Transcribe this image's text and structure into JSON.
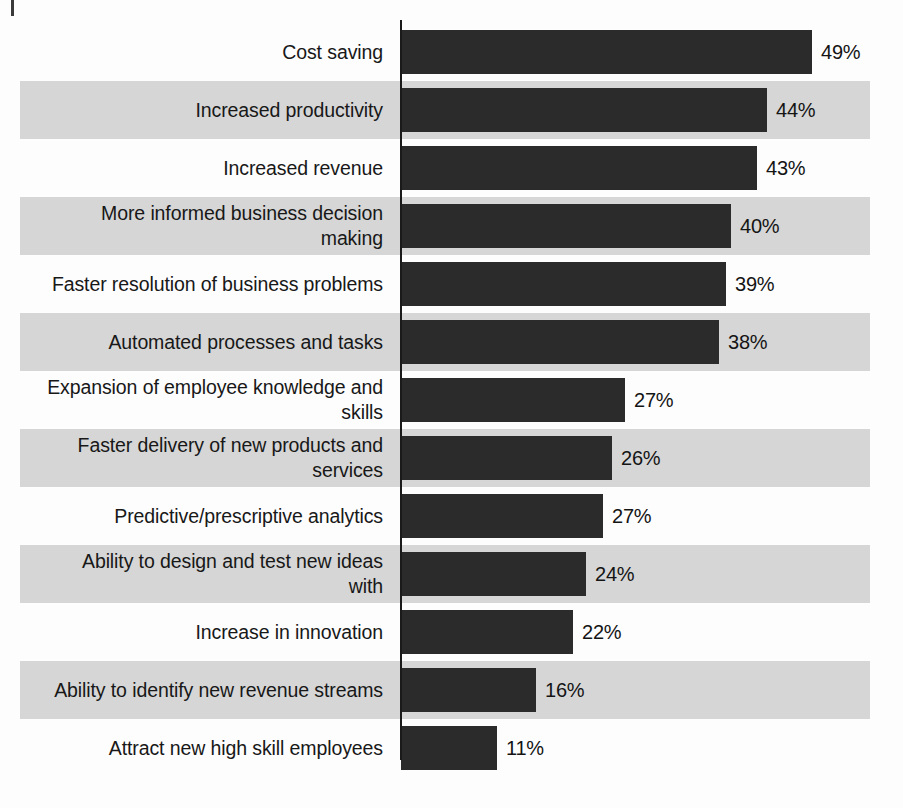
{
  "chart_data": {
    "type": "bar",
    "orientation": "horizontal",
    "title": "",
    "subtitle": "",
    "xlabel": "",
    "ylabel": "",
    "grid": false,
    "legend": null,
    "axis_visible": true,
    "value_suffix": "%",
    "xlim": [
      0,
      49
    ],
    "categories": [
      "Cost saving",
      "Increased productivity",
      "Increased revenue",
      "More informed business decision\nmaking",
      "Faster resolution of business problems",
      "Automated processes and tasks",
      "Expansion of employee knowledge and\nskills",
      "Faster delivery of new products and\nservices",
      "Predictive/prescriptive analytics",
      "Ability to design and test new ideas\nwith",
      "Increase in innovation",
      "Ability to identify new revenue streams",
      "Attract new high skill employees"
    ],
    "values": [
      49,
      44,
      43,
      40,
      39,
      38,
      27,
      26,
      27,
      24,
      22,
      16,
      11
    ],
    "value_labels": [
      "49%",
      "44%",
      "43%",
      "40%",
      "39%",
      "38%",
      "27%",
      "26%",
      "27%",
      "24%",
      "22%",
      "16%",
      "11%"
    ],
    "bar_pixel_widths": [
      411,
      366,
      356,
      330,
      325,
      318,
      224,
      211,
      202,
      185,
      172,
      135,
      96
    ],
    "colors": {
      "bar": "#2b2b2b",
      "band": "#d6d6d6",
      "background": "#fdfdfd",
      "axis": "#1a1a1a",
      "label_text": "#181818",
      "value_text": "#141414"
    }
  },
  "footer": {
    "bleed_text": ""
  }
}
